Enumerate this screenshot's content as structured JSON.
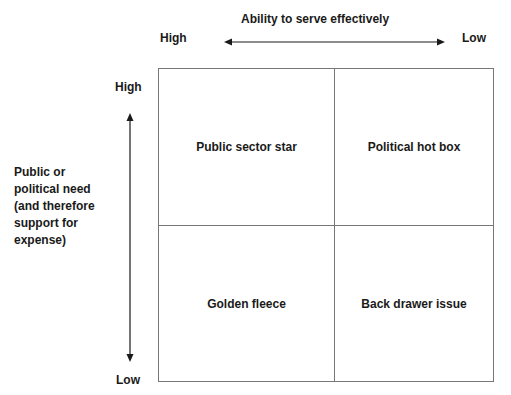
{
  "top_axis": {
    "title": "Ability to serve effectively",
    "left_label": "High",
    "right_label": "Low"
  },
  "left_axis": {
    "title": "Public or political need (and therefore support for expense)",
    "title_lines": [
      "Public or",
      "political need",
      "(and therefore",
      "support for",
      "expense)"
    ],
    "top_label": "High",
    "bottom_label": "Low"
  },
  "quadrants": {
    "top_left": "Public sector star",
    "top_right": "Political hot box",
    "bottom_left": "Golden fleece",
    "bottom_right": "Back drawer issue"
  }
}
